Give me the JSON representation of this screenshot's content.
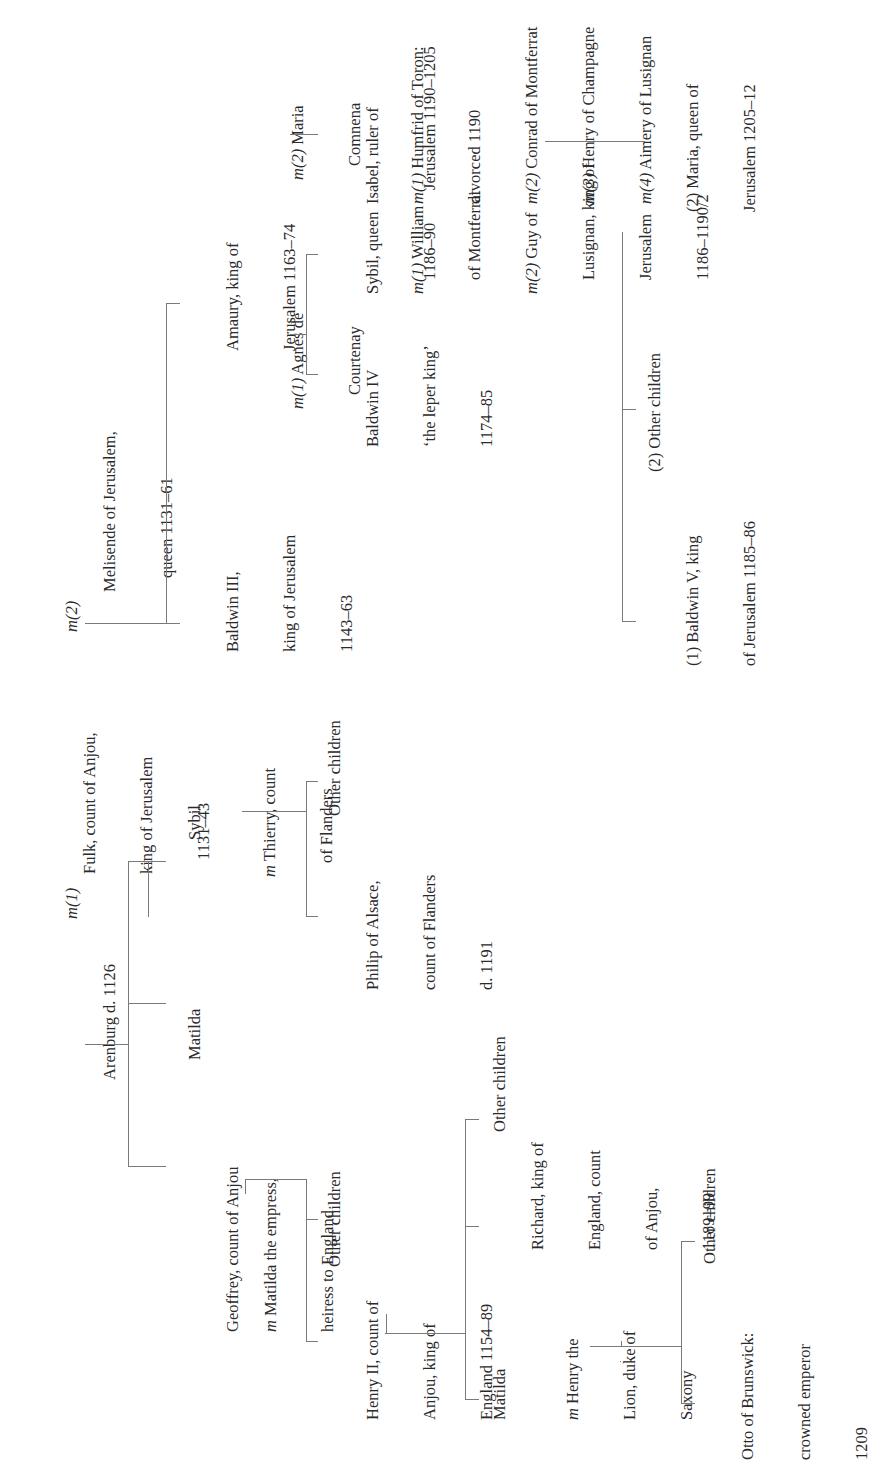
{
  "diagram": {
    "type": "genealogy-tree",
    "orientation": "rotated-90-ccw",
    "line_color": "#7a7a7a",
    "text_color": "#2a2a2a",
    "generation_1": {
      "first_wife": {
        "name": "Arenburg d. 1126",
        "marriage_label": "m(1)"
      },
      "patriarch": {
        "lines": [
          "Fulk, count of Anjou,",
          "king of Jerusalem",
          "1131–43"
        ]
      },
      "second_wife": {
        "marriage_label": "m(2)",
        "lines": [
          "Melisende of Jerusalem,",
          "queen 1131–61"
        ]
      }
    },
    "generation_2": {
      "geoffrey": {
        "name": "Geoffrey, count of Anjou",
        "spouse_prefix": "m",
        "spouse_lines": [
          "Matilda the empress,",
          "heiress to England"
        ]
      },
      "matilda": {
        "name": "Matilda"
      },
      "sybil": {
        "name": "Sybil",
        "spouse_prefix": "m",
        "spouse_lines": [
          "Thierry, count",
          "of Flanders"
        ]
      },
      "baldwin3": {
        "lines": [
          "Baldwin III,",
          "king of Jerusalem",
          "1143–63"
        ]
      },
      "amaury": {
        "lines": [
          "Amaury, king of",
          "Jerusalem 1163–74"
        ]
      },
      "amaury_wife1": {
        "prefix": "m(1)",
        "lines": [
          "Agnes de",
          "Courtenay"
        ]
      },
      "amaury_wife2": {
        "prefix": "m(2)",
        "lines": [
          "Maria",
          "Comnena"
        ]
      }
    },
    "generation_3": {
      "henry2": {
        "lines": [
          "Henry II, count of",
          "Anjou, king of",
          "England 1154–89"
        ]
      },
      "geoffrey_other": {
        "name": "Other children"
      },
      "philip": {
        "lines": [
          "Philip of Alsace,",
          "count of Flanders",
          "d. 1191"
        ]
      },
      "sybil_other": {
        "name": "Other children"
      },
      "baldwin4": {
        "lines": [
          "Baldwin IV",
          "‘the leper king’",
          "1174–85"
        ]
      },
      "sybil_queen": {
        "lines": [
          "Sybil, queen",
          "1186–90"
        ],
        "marriages": [
          {
            "prefix": "m(1)",
            "text": "William"
          },
          {
            "prefix": "",
            "text": "of Montferrat"
          },
          {
            "prefix": "m(2)",
            "text": "Guy of"
          },
          {
            "prefix": "",
            "text": "Lusignan, king of"
          },
          {
            "prefix": "",
            "text": "Jerusalem"
          },
          {
            "prefix": "",
            "text": "1186–1190/2"
          }
        ]
      },
      "isabel": {
        "lines": [
          "Isabel, ruler of",
          "Jerusalem 1190–1205"
        ],
        "marriages": [
          {
            "prefix": "m(1)",
            "text": "Humfrid of Toron:"
          },
          {
            "prefix": "",
            "text": "divorced 1190"
          },
          {
            "prefix": "m(2)",
            "text": "Conrad of Montferrat"
          },
          {
            "prefix": "m(3)",
            "text": "Henry of Champagne"
          },
          {
            "prefix": "m(4)",
            "text": "Aimery of Lusignan"
          }
        ]
      }
    },
    "generation_4": {
      "matilda_saxony": {
        "name": "Matilda",
        "spouse_prefix": "m",
        "spouse_lines": [
          "Henry the",
          "Lion, duke of",
          "Saxony"
        ]
      },
      "richard": {
        "lines": [
          "Richard, king of",
          "England, count",
          "of Anjou,",
          "1189–99"
        ]
      },
      "henry_other": {
        "name": "Other children"
      },
      "baldwin5": {
        "lines": [
          "(1) Baldwin V, king",
          "of Jerusalem 1185–86"
        ]
      },
      "sybil_queen_other": {
        "name": "(2) Other children"
      },
      "maria": {
        "lines": [
          "(2) Maria, queen of",
          "Jerusalem 1205–12"
        ]
      }
    },
    "generation_5": {
      "otto": {
        "lines": [
          "Otto of Brunswick:",
          "crowned emperor",
          "1209"
        ]
      },
      "matilda_other": {
        "name": "Other children"
      }
    }
  }
}
